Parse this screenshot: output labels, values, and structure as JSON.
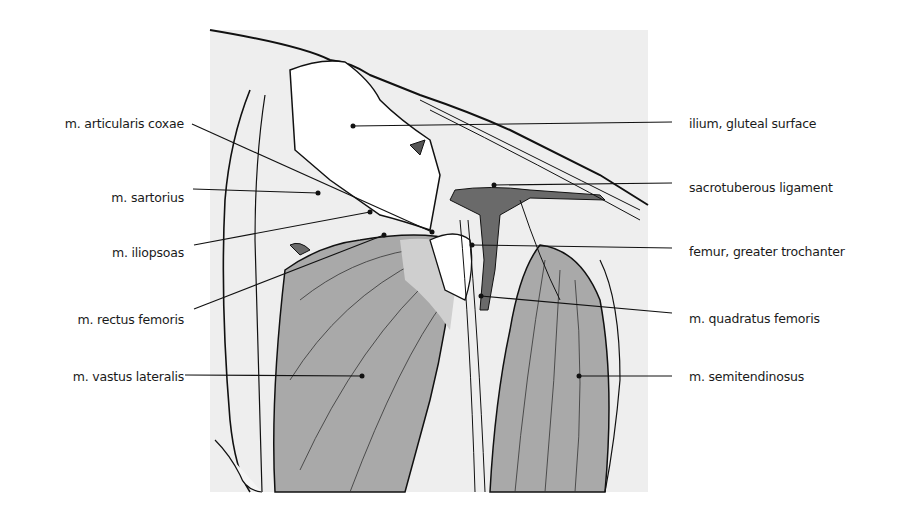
{
  "figure": {
    "type": "anatomical-illustration",
    "colors": {
      "background_panel": "#eeeeee",
      "muscle_fill": "#a9a9a9",
      "vessel_fill": "#6a6a6a",
      "line": "#111111"
    }
  },
  "labels": {
    "left": [
      {
        "id": "articularis",
        "text": "m. articularis coxae"
      },
      {
        "id": "sartorius",
        "text": "m. sartorius"
      },
      {
        "id": "iliopsoas",
        "text": "m. iliopsoas"
      },
      {
        "id": "rectus",
        "text": "m. rectus femoris"
      },
      {
        "id": "vastus",
        "text": "m. vastus lateralis"
      }
    ],
    "right": [
      {
        "id": "ilium",
        "text": "ilium, gluteal surface"
      },
      {
        "id": "sacrotuberous",
        "text": "sacrotuberous ligament"
      },
      {
        "id": "femur",
        "text": "femur,  greater trochanter"
      },
      {
        "id": "quadratus",
        "text": "m. quadratus femoris"
      },
      {
        "id": "semitendinosus",
        "text": "m. semitendinosus"
      }
    ]
  }
}
